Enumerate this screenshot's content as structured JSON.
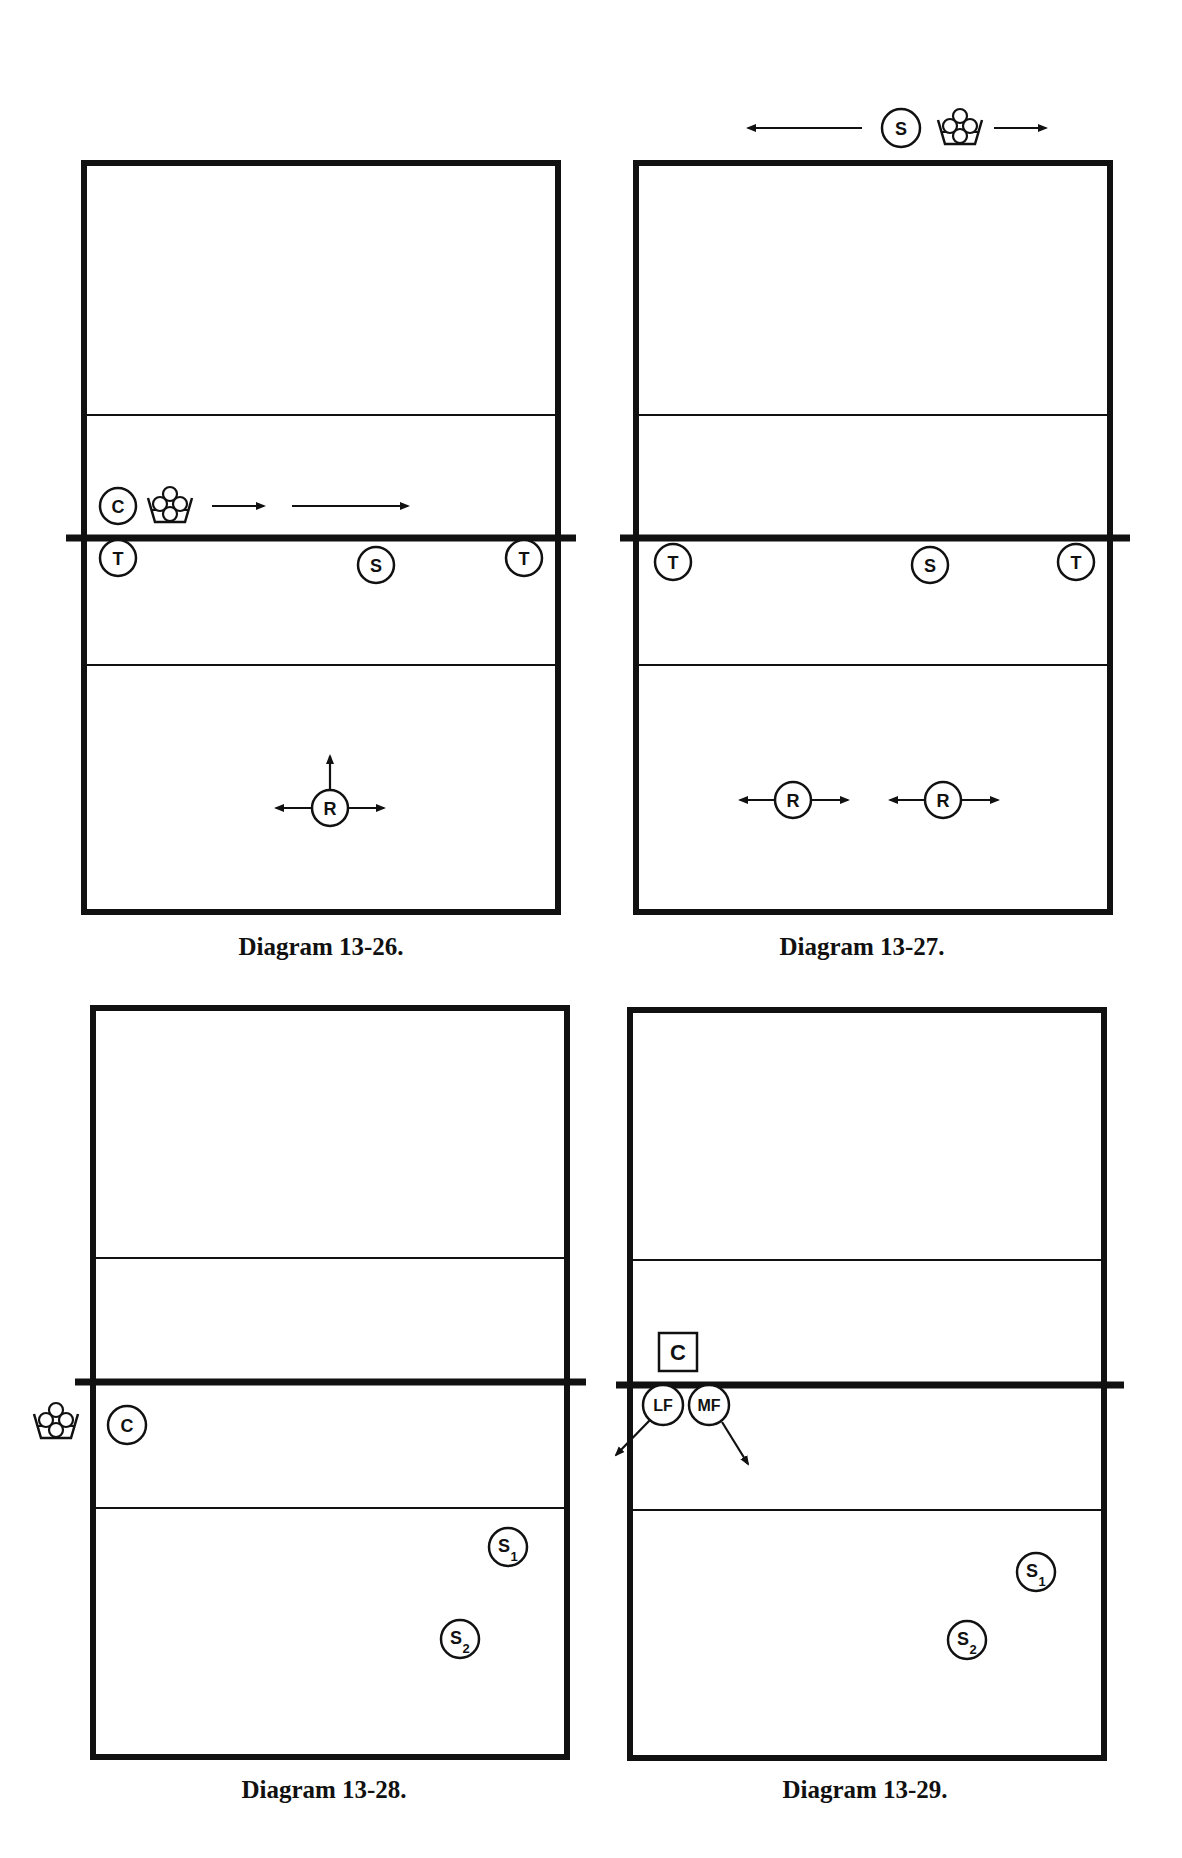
{
  "diagrams": [
    {
      "caption": "Diagram 13-26.",
      "court": {
        "x": 84,
        "y": 163,
        "w": 474,
        "h": 749,
        "line1_y": 415,
        "net_y": 538,
        "line2_y": 665
      },
      "players": [
        {
          "label": "C",
          "x": 118,
          "y": 506
        },
        {
          "label": "T",
          "x": 118,
          "y": 558
        },
        {
          "label": "S",
          "x": 376,
          "y": 565
        },
        {
          "label": "T",
          "x": 524,
          "y": 558
        },
        {
          "label": "R",
          "x": 330,
          "y": 808
        }
      ],
      "baskets": [
        {
          "x": 170,
          "y": 506
        }
      ]
    },
    {
      "caption": "Diagram 13-27.",
      "court": {
        "x": 636,
        "y": 163,
        "w": 474,
        "h": 749,
        "line1_y": 415,
        "net_y": 538,
        "line2_y": 665
      },
      "players": [
        {
          "label": "S",
          "x": 901,
          "y": 128
        },
        {
          "label": "T",
          "x": 673,
          "y": 562
        },
        {
          "label": "S",
          "x": 930,
          "y": 565
        },
        {
          "label": "T",
          "x": 1076,
          "y": 562
        },
        {
          "label": "R",
          "x": 793,
          "y": 800
        },
        {
          "label": "R",
          "x": 943,
          "y": 800
        }
      ],
      "baskets": [
        {
          "x": 960,
          "y": 128
        }
      ]
    },
    {
      "caption": "Diagram 13-28.",
      "court": {
        "x": 93,
        "y": 1008,
        "w": 474,
        "h": 749,
        "line1_y": 1258,
        "net_y": 1382,
        "line2_y": 1508
      },
      "players": [
        {
          "label": "C",
          "x": 127,
          "y": 1425
        },
        {
          "label": "S",
          "sub": "1",
          "x": 508,
          "y": 1547
        },
        {
          "label": "S",
          "sub": "2",
          "x": 460,
          "y": 1639
        }
      ],
      "baskets": [
        {
          "x": 56,
          "y": 1422
        }
      ]
    },
    {
      "caption": "Diagram 13-29.",
      "court": {
        "x": 630,
        "y": 1010,
        "w": 474,
        "h": 748,
        "line1_y": 1260,
        "net_y": 1385,
        "line2_y": 1510
      },
      "players": [
        {
          "label": "LF",
          "x": 663,
          "y": 1405
        },
        {
          "label": "MF",
          "x": 709,
          "y": 1405
        },
        {
          "label": "S",
          "sub": "1",
          "x": 1036,
          "y": 1572
        },
        {
          "label": "S",
          "sub": "2",
          "x": 967,
          "y": 1640
        }
      ],
      "coach_box": {
        "label": "C",
        "x": 678,
        "y": 1351
      },
      "baskets": []
    }
  ]
}
